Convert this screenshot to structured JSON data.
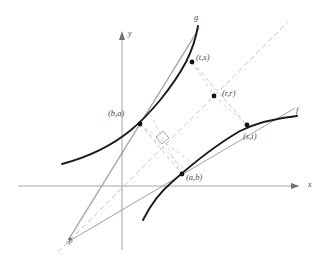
{
  "figure": {
    "axes": {
      "x_label": "x",
      "y_label": "y",
      "color": "#9a9a9a"
    },
    "curves": [
      {
        "id": "g",
        "label": "g",
        "role": "steep-curve",
        "color": "#1a1a1a"
      },
      {
        "id": "f",
        "label": "f",
        "role": "shallow-curve",
        "color": "#1a1a1a"
      }
    ],
    "points": [
      {
        "id": "ts",
        "label": "(t,s)",
        "x": 192,
        "y": 62
      },
      {
        "id": "ba",
        "label": "(b,a)",
        "x": 140,
        "y": 124
      },
      {
        "id": "rr",
        "label": "(r,r)",
        "x": 214,
        "y": 96
      },
      {
        "id": "st",
        "label": "(s,t)",
        "x": 247,
        "y": 125
      },
      {
        "id": "ab",
        "label": "(a,b)",
        "x": 182,
        "y": 174
      },
      {
        "id": "P",
        "label": "P",
        "x": 72,
        "y": 234
      }
    ],
    "markers": {
      "right_angle": "perpendicular-marker",
      "identity_line": "y = x",
      "dash_color": "#b9b9b9",
      "tangent_color": "#8c8c8c"
    }
  }
}
